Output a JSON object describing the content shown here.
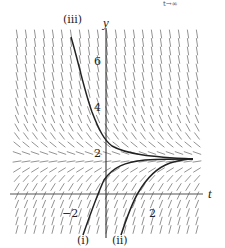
{
  "header": {
    "partial_text": "t→∞"
  },
  "chart_data": {
    "type": "slope_field",
    "title": "",
    "equation_hint": "dy/dt = 2 - y",
    "xlabel": "t",
    "ylabel": "y",
    "equilibrium": 2,
    "x_ticks": [
      {
        "value": -2,
        "label": "−2"
      },
      {
        "value": 2,
        "label": "2"
      }
    ],
    "y_ticks": [
      {
        "value": 2,
        "label": "2"
      },
      {
        "value": 4,
        "label": "4"
      },
      {
        "value": 6,
        "label": "6"
      }
    ],
    "xlim": [
      -4,
      4
    ],
    "ylim": [
      -2,
      7
    ],
    "grid": false,
    "series": [
      {
        "name": "(i)",
        "description": "solution starting below axis left of origin, increasing toward y = 2"
      },
      {
        "name": "(ii)",
        "description": "solution starting below axis right of origin, increasing toward y = 2"
      },
      {
        "name": "(iii)",
        "description": "solution starting high (y > 6), decreasing toward y = 2"
      }
    ]
  },
  "labels": {
    "y_axis": "y",
    "t_axis": "t",
    "tick_y6": "6",
    "tick_y4": "4",
    "tick_y2": "2",
    "tick_tm2": "−2",
    "tick_t2": "2",
    "curve_i": "(i)",
    "curve_ii": "(ii)",
    "curve_iii": "(iii)"
  }
}
